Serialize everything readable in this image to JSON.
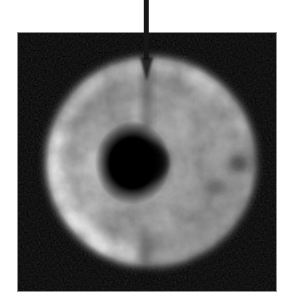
{
  "figure": {
    "kind": "grayscale-experimental-image",
    "canvas_background": "#ffffff",
    "frame": {
      "fill": "#050505",
      "border_color": "#8f8f8f"
    },
    "ring": {
      "base_gray": "#8f8f8f",
      "bright_rim": "#d8d8d8",
      "top_rim": "#c4c4c4",
      "inner_glow": "#bdbdbd",
      "dark_patch": "#1f1f1f",
      "hole_color": "#000000",
      "streak_color": "#000000"
    },
    "arrow": {
      "color": "#171717",
      "direction": "down"
    }
  }
}
